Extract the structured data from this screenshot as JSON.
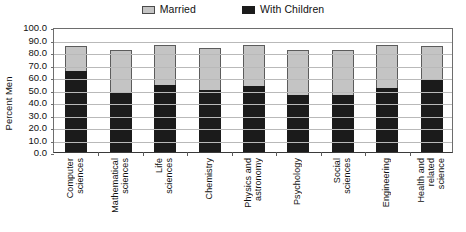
{
  "legend": {
    "entries": [
      {
        "label": "Married",
        "swatch": "legend-swatch-married",
        "color": "#c4c4c4"
      },
      {
        "label": "With Children",
        "swatch": "legend-swatch-children",
        "color": "#1b1b1b"
      }
    ]
  },
  "chart_data": {
    "type": "bar",
    "title": "",
    "subtitle": "",
    "xlabel": "",
    "ylabel": "Percent Men",
    "ylim": [
      0,
      100
    ],
    "ytick_step": 10,
    "ytick_labels": [
      "100.0",
      "90.0",
      "80.0",
      "70.0",
      "60.0",
      "50.0",
      "40.0",
      "30.0",
      "20.0",
      "10.0",
      "0.0"
    ],
    "ytick_values": [
      100,
      90,
      80,
      70,
      60,
      50,
      40,
      30,
      20,
      10,
      0
    ],
    "grid": true,
    "legend_position": "top-center",
    "stacked": false,
    "note": "Married is the total bar height; With Children is drawn over it from the baseline.",
    "categories": [
      "Computer sciences",
      "Mathematical sciences",
      "Life sciences",
      "Chemistry",
      "Physics and astronomy",
      "Psychology",
      "Social sciences",
      "Engineering",
      "Health and related science"
    ],
    "category_lines": [
      [
        "Computer",
        "sciences"
      ],
      [
        "Mathematical",
        "sciences"
      ],
      [
        "Life",
        "sciences"
      ],
      [
        "Chemistry"
      ],
      [
        "Physics and",
        "astronomy"
      ],
      [
        "Psychology"
      ],
      [
        "Social",
        "sciences"
      ],
      [
        "Engineering"
      ],
      [
        "Health and",
        "related",
        "science"
      ]
    ],
    "series": [
      {
        "name": "Married",
        "color": "#c4c4c4",
        "values": [
          85.0,
          81.5,
          85.5,
          83.0,
          86.0,
          82.0,
          81.5,
          86.0,
          84.5
        ]
      },
      {
        "name": "With Children",
        "color": "#1b1b1b",
        "values": [
          65.0,
          48.0,
          53.5,
          49.5,
          52.5,
          46.0,
          45.5,
          51.0,
          58.0
        ]
      }
    ]
  }
}
